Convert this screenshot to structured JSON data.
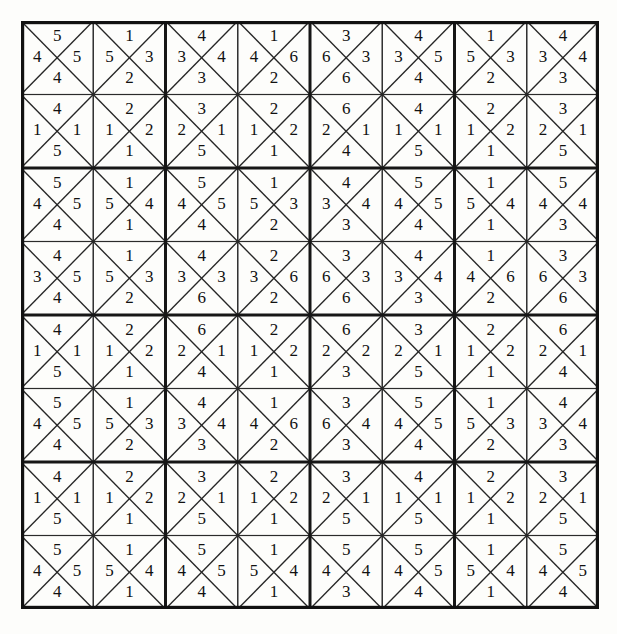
{
  "page": {
    "background_color": "#fdfdfb",
    "ink_color": "#111111"
  },
  "grid": {
    "columns": 8,
    "rows": 8,
    "cell_size": 72.25,
    "block_columns": 4,
    "block_rows": 4,
    "cell_shape": "square-divided-by-both-diagonals-into-four-triangles",
    "triangle_order": [
      "top",
      "right",
      "bottom",
      "left"
    ],
    "cells": [
      [
        {
          "top": "5",
          "right": "5",
          "bottom": "4",
          "left": "4"
        },
        {
          "top": "1",
          "right": "3",
          "bottom": "2",
          "left": "5"
        },
        {
          "top": "4",
          "right": "4",
          "bottom": "3",
          "left": "3"
        },
        {
          "top": "1",
          "right": "6",
          "bottom": "2",
          "left": "4"
        },
        {
          "top": "3",
          "right": "3",
          "bottom": "6",
          "left": "6"
        },
        {
          "top": "4",
          "right": "5",
          "bottom": "4",
          "left": "3"
        },
        {
          "top": "1",
          "right": "3",
          "bottom": "2",
          "left": "5"
        },
        {
          "top": "4",
          "right": "4",
          "bottom": "3",
          "left": "3"
        }
      ],
      [
        {
          "top": "4",
          "right": "1",
          "bottom": "5",
          "left": "1"
        },
        {
          "top": "2",
          "right": "2",
          "bottom": "1",
          "left": "1"
        },
        {
          "top": "3",
          "right": "1",
          "bottom": "5",
          "left": "2"
        },
        {
          "top": "2",
          "right": "2",
          "bottom": "1",
          "left": "1"
        },
        {
          "top": "6",
          "right": "1",
          "bottom": "4",
          "left": "2"
        },
        {
          "top": "4",
          "right": "1",
          "bottom": "5",
          "left": "1"
        },
        {
          "top": "2",
          "right": "2",
          "bottom": "1",
          "left": "1"
        },
        {
          "top": "3",
          "right": "1",
          "bottom": "5",
          "left": "2"
        }
      ],
      [
        {
          "top": "5",
          "right": "5",
          "bottom": "4",
          "left": "4"
        },
        {
          "top": "1",
          "right": "4",
          "bottom": "1",
          "left": "5"
        },
        {
          "top": "5",
          "right": "5",
          "bottom": "4",
          "left": "4"
        },
        {
          "top": "1",
          "right": "3",
          "bottom": "2",
          "left": "5"
        },
        {
          "top": "4",
          "right": "4",
          "bottom": "3",
          "left": "3"
        },
        {
          "top": "5",
          "right": "5",
          "bottom": "4",
          "left": "4"
        },
        {
          "top": "1",
          "right": "4",
          "bottom": "1",
          "left": "5"
        },
        {
          "top": "5",
          "right": "4",
          "bottom": "3",
          "left": "4"
        }
      ],
      [
        {
          "top": "4",
          "right": "5",
          "bottom": "4",
          "left": "3"
        },
        {
          "top": "1",
          "right": "3",
          "bottom": "2",
          "left": "5"
        },
        {
          "top": "4",
          "right": "3",
          "bottom": "6",
          "left": "3"
        },
        {
          "top": "2",
          "right": "6",
          "bottom": "2",
          "left": "3"
        },
        {
          "top": "3",
          "right": "3",
          "bottom": "6",
          "left": "6"
        },
        {
          "top": "4",
          "right": "4",
          "bottom": "3",
          "left": "3"
        },
        {
          "top": "1",
          "right": "6",
          "bottom": "2",
          "left": "4"
        },
        {
          "top": "3",
          "right": "3",
          "bottom": "6",
          "left": "6"
        }
      ],
      [
        {
          "top": "4",
          "right": "1",
          "bottom": "5",
          "left": "1"
        },
        {
          "top": "2",
          "right": "2",
          "bottom": "1",
          "left": "1"
        },
        {
          "top": "6",
          "right": "1",
          "bottom": "4",
          "left": "2"
        },
        {
          "top": "2",
          "right": "2",
          "bottom": "1",
          "left": "1"
        },
        {
          "top": "6",
          "right": "2",
          "bottom": "3",
          "left": "2"
        },
        {
          "top": "3",
          "right": "1",
          "bottom": "5",
          "left": "2"
        },
        {
          "top": "2",
          "right": "2",
          "bottom": "1",
          "left": "1"
        },
        {
          "top": "6",
          "right": "1",
          "bottom": "4",
          "left": "2"
        }
      ],
      [
        {
          "top": "5",
          "right": "5",
          "bottom": "4",
          "left": "4"
        },
        {
          "top": "1",
          "right": "3",
          "bottom": "2",
          "left": "5"
        },
        {
          "top": "4",
          "right": "4",
          "bottom": "3",
          "left": "3"
        },
        {
          "top": "1",
          "right": "6",
          "bottom": "2",
          "left": "4"
        },
        {
          "top": "3",
          "right": "4",
          "bottom": "3",
          "left": "6"
        },
        {
          "top": "5",
          "right": "5",
          "bottom": "4",
          "left": "4"
        },
        {
          "top": "1",
          "right": "3",
          "bottom": "2",
          "left": "5"
        },
        {
          "top": "4",
          "right": "4",
          "bottom": "3",
          "left": "3"
        }
      ],
      [
        {
          "top": "4",
          "right": "1",
          "bottom": "5",
          "left": "1"
        },
        {
          "top": "2",
          "right": "2",
          "bottom": "1",
          "left": "1"
        },
        {
          "top": "3",
          "right": "1",
          "bottom": "5",
          "left": "2"
        },
        {
          "top": "2",
          "right": "2",
          "bottom": "1",
          "left": "1"
        },
        {
          "top": "3",
          "right": "1",
          "bottom": "5",
          "left": "2"
        },
        {
          "top": "4",
          "right": "1",
          "bottom": "5",
          "left": "1"
        },
        {
          "top": "2",
          "right": "2",
          "bottom": "1",
          "left": "1"
        },
        {
          "top": "3",
          "right": "1",
          "bottom": "5",
          "left": "2"
        }
      ],
      [
        {
          "top": "5",
          "right": "5",
          "bottom": "4",
          "left": "4"
        },
        {
          "top": "1",
          "right": "4",
          "bottom": "1",
          "left": "5"
        },
        {
          "top": "5",
          "right": "5",
          "bottom": "4",
          "left": "4"
        },
        {
          "top": "1",
          "right": "4",
          "bottom": "1",
          "left": "5"
        },
        {
          "top": "5",
          "right": "4",
          "bottom": "3",
          "left": "4"
        },
        {
          "top": "5",
          "right": "5",
          "bottom": "4",
          "left": "4"
        },
        {
          "top": "1",
          "right": "4",
          "bottom": "1",
          "left": "5"
        },
        {
          "top": "5",
          "right": "5",
          "bottom": "4",
          "left": "4"
        }
      ]
    ]
  }
}
